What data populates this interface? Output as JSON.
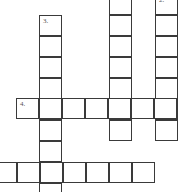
{
  "puzzle": {
    "type": "crossword",
    "clue_numbers_visible": [
      "2.",
      "3.",
      "4."
    ],
    "entries": [
      {
        "id": "col1",
        "direction": "down",
        "number": "",
        "length_visible": 7
      },
      {
        "id": "col2",
        "direction": "down",
        "number": "2.",
        "length_visible": 7
      },
      {
        "id": "col3",
        "direction": "down",
        "number": "3.",
        "length_visible": 8
      },
      {
        "id": "row4",
        "direction": "across",
        "number": "4.",
        "length_visible": 7
      },
      {
        "id": "row5",
        "direction": "across",
        "number": "",
        "length_visible": 7
      }
    ]
  },
  "labels": {
    "two": "2.",
    "three": "3.",
    "four": "4."
  },
  "colors": {
    "grid_line": "#3a3a3a",
    "background": "#ffffff",
    "number_text": "#555555"
  }
}
